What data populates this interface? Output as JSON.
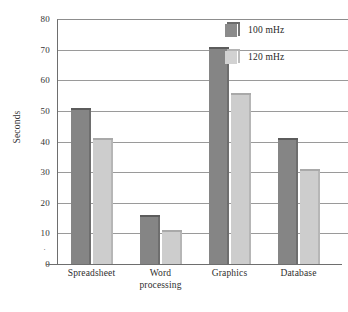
{
  "chart_data": {
    "type": "bar",
    "title": "",
    "subtitle": "",
    "xlabel": "",
    "ylabel": "Seconds",
    "ylim": [
      0,
      80
    ],
    "yticks": [
      0,
      10,
      20,
      30,
      40,
      50,
      60,
      70,
      80
    ],
    "ytick_labels": [
      "0",
      "10",
      "20",
      "30",
      "40",
      "50",
      "60",
      "70",
      "80"
    ],
    "grid": true,
    "grid_axis": "y",
    "legend_position": "top-right",
    "categories": [
      "Spreadsheet",
      "Word processing",
      "Graphics",
      "Database"
    ],
    "category_lines": [
      [
        "Spreadsheet"
      ],
      [
        "Word",
        "processing"
      ],
      [
        "Graphics"
      ],
      [
        "Database"
      ]
    ],
    "series": [
      {
        "name": "100 mHz",
        "color": "#858585",
        "values": [
          51,
          16,
          71,
          41
        ]
      },
      {
        "name": "120 mHz",
        "color": "#cdcdcd",
        "values": [
          41,
          11,
          56,
          31
        ]
      }
    ]
  },
  "legend": {
    "items": [
      {
        "label": "100 mHz",
        "swatch": "dark-gray-swatch"
      },
      {
        "label": "120 mHz",
        "swatch": "light-gray-swatch"
      }
    ]
  },
  "axis": {
    "y_title": "Seconds",
    "minor_dot": "·"
  },
  "colors": {
    "series_100mhz": "#858585",
    "series_120mhz": "#cdcdcd",
    "gridline": "#9a9a9a",
    "axis": "#6e6e6e",
    "text": "#2b2b2b",
    "background": "#ffffff"
  }
}
